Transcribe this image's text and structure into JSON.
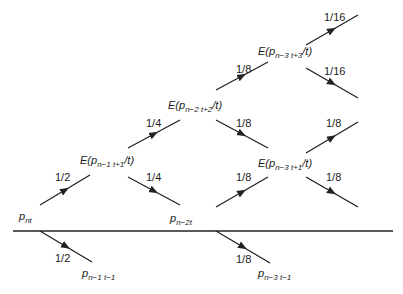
{
  "diagram": {
    "nodes": {
      "p_nt": {
        "main": "p",
        "sub": "nt"
      },
      "e1": {
        "pre": "E(p",
        "sub": "n−1  t+1",
        "post": "/t)"
      },
      "p_n2t": {
        "main": "p",
        "sub": "n−2t"
      },
      "p_n1_t1": {
        "main": "p",
        "sub": "n−1  t−1"
      },
      "e2": {
        "pre": "E(p",
        "sub": "n−2  t+2",
        "post": "/t)"
      },
      "e3_top": {
        "pre": "E(p",
        "sub": "n−3  t+3",
        "post": "/t)"
      },
      "e3_mid": {
        "pre": "E(p",
        "sub": "n−3  t+1",
        "post": "/t)"
      },
      "p_n3_t1": {
        "main": "p",
        "sub": "n−3  t−1"
      }
    },
    "edge_labels": {
      "a": "1/2",
      "b": "1/2",
      "c": "1/4",
      "d": "1/4",
      "e": "1/8",
      "f": "1/8",
      "g": "1/16",
      "h": "1/16",
      "i": "1/8",
      "j": "1/8",
      "k": "1/8",
      "l": "1/8"
    },
    "colors": {
      "line": "#222222",
      "text": "#222222"
    }
  }
}
